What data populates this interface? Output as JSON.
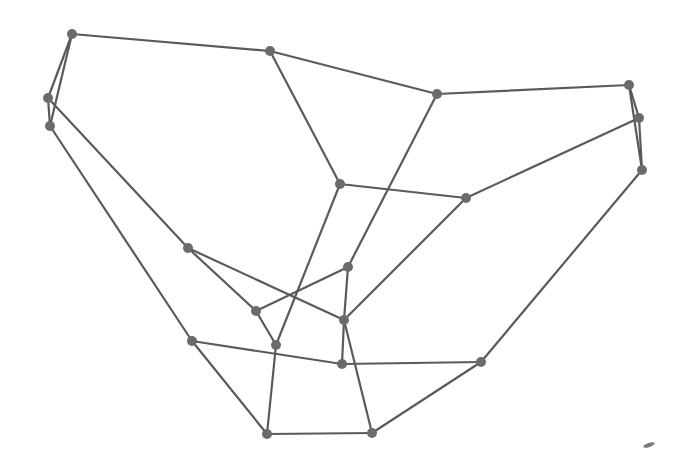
{
  "diagram": {
    "type": "graph",
    "directed": false,
    "colors": {
      "edge": "#5a5a5a",
      "node": "#6b6b6b",
      "background": "#ffffff"
    },
    "node_radius": 5,
    "nodes": [
      {
        "id": 0,
        "x": 72,
        "y": 34
      },
      {
        "id": 1,
        "x": 270,
        "y": 51
      },
      {
        "id": 2,
        "x": 437,
        "y": 94
      },
      {
        "id": 3,
        "x": 629,
        "y": 85
      },
      {
        "id": 4,
        "x": 639,
        "y": 118
      },
      {
        "id": 5,
        "x": 642,
        "y": 170
      },
      {
        "id": 6,
        "x": 48,
        "y": 98
      },
      {
        "id": 7,
        "x": 50,
        "y": 126
      },
      {
        "id": 8,
        "x": 340,
        "y": 184
      },
      {
        "id": 9,
        "x": 466,
        "y": 198
      },
      {
        "id": 10,
        "x": 188,
        "y": 248
      },
      {
        "id": 11,
        "x": 348,
        "y": 267
      },
      {
        "id": 12,
        "x": 256,
        "y": 311
      },
      {
        "id": 13,
        "x": 344,
        "y": 320
      },
      {
        "id": 14,
        "x": 192,
        "y": 341
      },
      {
        "id": 15,
        "x": 276,
        "y": 345
      },
      {
        "id": 16,
        "x": 342,
        "y": 364
      },
      {
        "id": 17,
        "x": 481,
        "y": 362
      },
      {
        "id": 18,
        "x": 267,
        "y": 434
      },
      {
        "id": 19,
        "x": 372,
        "y": 433
      }
    ],
    "edges": [
      [
        0,
        1
      ],
      [
        0,
        6
      ],
      [
        0,
        7
      ],
      [
        6,
        7
      ],
      [
        1,
        2
      ],
      [
        1,
        8
      ],
      [
        2,
        3
      ],
      [
        2,
        11
      ],
      [
        3,
        4
      ],
      [
        3,
        5
      ],
      [
        4,
        5
      ],
      [
        4,
        9
      ],
      [
        5,
        17
      ],
      [
        8,
        9
      ],
      [
        8,
        15
      ],
      [
        9,
        13
      ],
      [
        6,
        10
      ],
      [
        7,
        14
      ],
      [
        10,
        12
      ],
      [
        10,
        13
      ],
      [
        12,
        11
      ],
      [
        12,
        15
      ],
      [
        11,
        13
      ],
      [
        13,
        16
      ],
      [
        13,
        19
      ],
      [
        14,
        16
      ],
      [
        14,
        18
      ],
      [
        16,
        17
      ],
      [
        15,
        18
      ],
      [
        18,
        19
      ],
      [
        19,
        17
      ]
    ],
    "artifact": {
      "x": 649,
      "y": 445
    }
  }
}
